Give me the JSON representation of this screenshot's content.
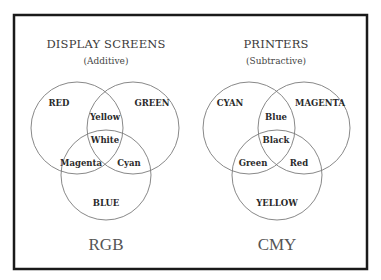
{
  "diagrams": [
    {
      "title": "DISPLAY SCREENS",
      "subtitle": "(Additive)",
      "model_label": "RGB",
      "circles": [
        {
          "label": "RED"
        },
        {
          "label": "GREEN"
        },
        {
          "label": "BLUE"
        }
      ],
      "overlaps": {
        "top_pair": "Yellow",
        "center": "White",
        "left_pair": "Magenta",
        "right_pair": "Cyan"
      }
    },
    {
      "title": "PRINTERS",
      "subtitle": "(Subtractive)",
      "model_label": "CMY",
      "circles": [
        {
          "label": "CYAN"
        },
        {
          "label": "MAGENTA"
        },
        {
          "label": "YELLOW"
        }
      ],
      "overlaps": {
        "top_pair": "Blue",
        "center": "Black",
        "left_pair": "Green",
        "right_pair": "Red"
      }
    }
  ],
  "colors": {
    "frame": "#1a1a1a",
    "circle_stroke": "#7a7a7a",
    "background": "#ffffff"
  }
}
